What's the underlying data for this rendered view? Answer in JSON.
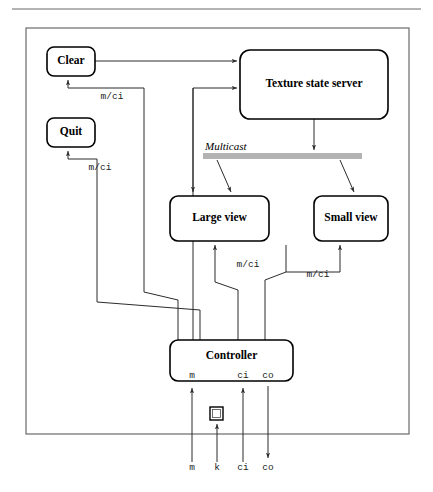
{
  "figure": {
    "nodes": [
      {
        "id": "clear",
        "label": "Clear",
        "x": 47,
        "y": 47,
        "w": 48,
        "h": 29,
        "r": 7,
        "font_size": 11.5
      },
      {
        "id": "quit",
        "label": "Quit",
        "x": 47,
        "y": 118,
        "w": 48,
        "h": 29,
        "r": 7,
        "font_size": 11.5
      },
      {
        "id": "server",
        "label": "Texture state server",
        "x": 240,
        "y": 50,
        "w": 148,
        "h": 69,
        "r": 10,
        "font_size": 11.5
      },
      {
        "id": "large",
        "label": "Large view",
        "x": 170,
        "y": 196,
        "w": 99,
        "h": 45,
        "r": 8,
        "font_size": 11.5
      },
      {
        "id": "small",
        "label": "Small view",
        "x": 314,
        "y": 196,
        "w": 74,
        "h": 45,
        "r": 8,
        "font_size": 11.5
      },
      {
        "id": "ctrl",
        "label": "Controller",
        "x": 170,
        "y": 340,
        "w": 123,
        "h": 41,
        "r": 8,
        "font_size": 11.5
      }
    ],
    "bus": {
      "label": "Multicast",
      "label_x": 205,
      "label_y": 150,
      "label_font_size": 11,
      "x": 203,
      "y": 153,
      "w": 159,
      "h": 6,
      "color": "#b3b3b3"
    },
    "edge_labels": [
      {
        "id": "clear-mci",
        "text": "m/ci",
        "x": 112,
        "y": 99,
        "font_size": 9.5
      },
      {
        "id": "quit-mci",
        "text": "m/ci",
        "x": 100,
        "y": 170,
        "font_size": 9.5
      },
      {
        "id": "large-mci",
        "text": "m/ci",
        "x": 248,
        "y": 267,
        "font_size": 9.5
      },
      {
        "id": "small-mci",
        "text": "m/ci",
        "x": 318,
        "y": 277,
        "font_size": 9.5
      }
    ],
    "controller_ports": [
      {
        "id": "port-m",
        "text": "m",
        "x": 192,
        "y": 378,
        "font_size": 9.5
      },
      {
        "id": "port-ci",
        "text": "ci",
        "x": 243,
        "y": 378,
        "font_size": 9.5
      },
      {
        "id": "port-co",
        "text": "co",
        "x": 268,
        "y": 378,
        "font_size": 9.5
      }
    ],
    "external_ports": [
      {
        "id": "ext-m",
        "text": "m",
        "x": 192,
        "y": 470,
        "font_size": 9.5
      },
      {
        "id": "ext-k",
        "text": "k",
        "x": 217,
        "y": 470,
        "font_size": 9.5
      },
      {
        "id": "ext-ci",
        "text": "ci",
        "x": 243,
        "y": 470,
        "font_size": 9.5
      },
      {
        "id": "ext-co",
        "text": "co",
        "x": 268,
        "y": 470,
        "font_size": 9.5
      }
    ],
    "keyboard_icon": {
      "x": 210,
      "y": 407,
      "w": 13,
      "h": 13
    },
    "frame": {
      "x": 26,
      "y": 28,
      "w": 383,
      "h": 406
    },
    "top_rule": {
      "x1": 12,
      "y1": 9,
      "x2": 421,
      "y2": 9
    },
    "wires": [
      {
        "id": "clear-to-server",
        "d": "M 95 61 L 237 61",
        "arrow": "end-right"
      },
      {
        "id": "ctrl-to-server",
        "d": "M 193 349 L 193 88 L 237 88",
        "arrow": "end-right"
      },
      {
        "id": "server-to-bus",
        "d": "M 314 119 L 314 150",
        "arrow": "end-down"
      },
      {
        "id": "bus-to-large",
        "d": "M 217 160 L 231 192",
        "arrow": "end-down-diag"
      },
      {
        "id": "bus-to-small",
        "d": "M 340 160 L 354 192",
        "arrow": "end-down-diag"
      },
      {
        "id": "server-spur-to-large",
        "d": "M 193 88 L 193 192",
        "arrow": "end-down"
      },
      {
        "id": "ctrl-to-large",
        "d": "M 238 349 L 238 290 L 215 282 L 215 245",
        "arrow": "end-up"
      },
      {
        "id": "ctrl-to-small",
        "d": "M 265 349 L 265 280 L 286 272 L 286 245",
        "arrow": "none"
      },
      {
        "id": "ctrl-to-small-2",
        "d": "M 286 272 L 340 272 L 340 245",
        "arrow": "end-up"
      },
      {
        "id": "ctrl-to-clear",
        "d": "M 178 349 L 178 300 L 144 292 L 144 88 L 68 88 L 68 80",
        "arrow": "end-up"
      },
      {
        "id": "ctrl-to-quit",
        "d": "M 200 349 L 200 310 L 97 302 L 97 159 L 68 159 L 68 151",
        "arrow": "end-up"
      },
      {
        "id": "ext-m-to-port",
        "d": "M 192 462 L 192 388",
        "arrow": "end-up"
      },
      {
        "id": "ext-k-to-icon",
        "d": "M 217 462 L 217 424",
        "arrow": "end-up"
      },
      {
        "id": "ext-ci-to-port",
        "d": "M 243 462 L 243 388",
        "arrow": "end-up"
      },
      {
        "id": "port-co-to-ext",
        "d": "M 268 386 L 268 458",
        "arrow": "end-down"
      }
    ]
  }
}
